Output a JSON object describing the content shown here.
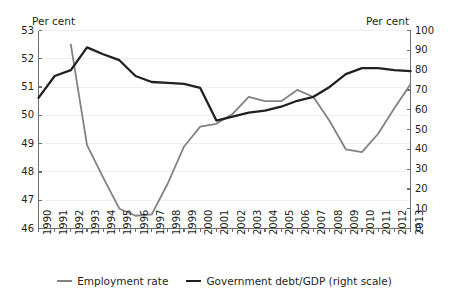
{
  "chart_data": {
    "type": "line",
    "title": "",
    "subtitle": "",
    "xlabel": "",
    "ylabel": "Per cent",
    "ylabel_right": "Per cent",
    "left_axis_title": "Per cent",
    "right_axis_title": "Per cent",
    "grid": true,
    "legend_position": "bottom",
    "x": [
      1990,
      1991,
      1992,
      1993,
      1994,
      1995,
      1996,
      1997,
      1998,
      1999,
      2000,
      2001,
      2002,
      2003,
      2004,
      2005,
      2006,
      2007,
      2008,
      2009,
      2010,
      2011,
      2012,
      2013
    ],
    "categories": [
      "1990",
      "1991",
      "1992",
      "1993",
      "1994",
      "1995",
      "1996",
      "1997",
      "1998",
      "1999",
      "2000",
      "2001",
      "2002",
      "2003",
      "2004",
      "2005",
      "2006",
      "2007",
      "2008",
      "2009",
      "2010",
      "2011",
      "2012",
      "2013"
    ],
    "ylim": [
      46,
      53
    ],
    "yticks": [
      46,
      47,
      48,
      49,
      50,
      51,
      52,
      53
    ],
    "ylim_right": [
      0,
      100
    ],
    "yticks_right": [
      0,
      10,
      20,
      30,
      40,
      50,
      60,
      70,
      80,
      90,
      100
    ],
    "series": [
      {
        "name": "Employment rate",
        "legend_label": "Employment rate",
        "axis": "left",
        "color": "#808285",
        "x": [
          1992,
          1993,
          1994,
          1995,
          1996,
          1997,
          1998,
          1999,
          2000,
          2001,
          2002,
          2003,
          2004,
          2005,
          2006,
          2007,
          2008,
          2009,
          2010,
          2011,
          2012,
          2013
        ],
        "values": [
          52.5,
          48.95,
          47.8,
          46.7,
          46.45,
          46.5,
          47.6,
          48.9,
          49.6,
          49.7,
          50.05,
          50.65,
          50.5,
          50.5,
          50.9,
          50.65,
          49.8,
          48.8,
          48.7,
          49.35,
          50.25,
          51.1
        ]
      },
      {
        "name": "Government debt/GDP (right scale)",
        "legend_label": "Government debt/GDP (right scale)",
        "axis": "right",
        "color": "#231f20",
        "x": [
          1990,
          1991,
          1992,
          1993,
          1994,
          1995,
          1996,
          1997,
          1998,
          1999,
          2000,
          2001,
          2002,
          2003,
          2004,
          2005,
          2006,
          2007,
          2008,
          2009,
          2010,
          2011,
          2012,
          2013
        ],
        "values": [
          66,
          77,
          80,
          91.5,
          88,
          85,
          77,
          74,
          73.5,
          73,
          71,
          54.5,
          56.5,
          58.5,
          59.5,
          61.5,
          64.5,
          66.5,
          71.5,
          78,
          81,
          81,
          80,
          79.5
        ]
      }
    ]
  },
  "legend": {
    "items": [
      {
        "label": "Employment rate",
        "color": "#808285"
      },
      {
        "label": "Government debt/GDP (right scale)",
        "color": "#231f20"
      }
    ]
  }
}
